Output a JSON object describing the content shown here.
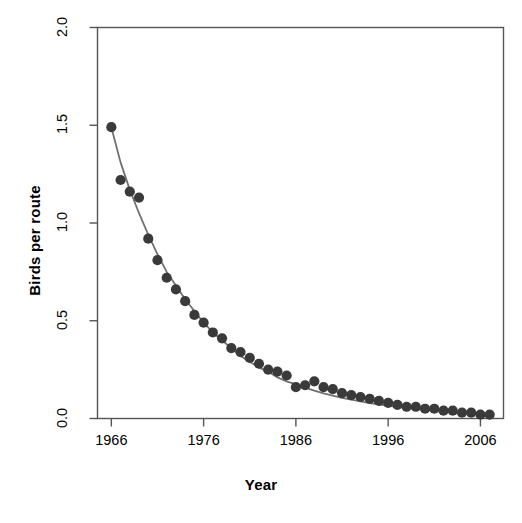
{
  "chart_data": {
    "type": "scatter",
    "title": "",
    "xlabel": "Year",
    "ylabel": "Birds per route",
    "xlim": [
      1964.5,
      2008.5
    ],
    "ylim": [
      0.0,
      2.0
    ],
    "grid": false,
    "legend": "none",
    "xticks": [
      1966,
      1976,
      1986,
      1996,
      2006
    ],
    "xtick_labels": [
      "1966",
      "1976",
      "1986",
      "1996",
      "2006"
    ],
    "yticks": [
      0.0,
      0.5,
      1.0,
      1.5,
      2.0
    ],
    "ytick_labels": [
      "0.0",
      "0.5",
      "1.0",
      "1.5",
      "2.0"
    ],
    "point_color": "#3a3a3a",
    "line_color": "#707070",
    "axis_color": "#555555",
    "series": [
      {
        "name": "Birds per route",
        "marker": "filled-circle",
        "x": [
          1966,
          1967,
          1968,
          1969,
          1970,
          1971,
          1972,
          1973,
          1974,
          1975,
          1976,
          1977,
          1978,
          1979,
          1980,
          1981,
          1982,
          1983,
          1984,
          1985,
          1986,
          1987,
          1988,
          1989,
          1990,
          1991,
          1992,
          1993,
          1994,
          1995,
          1996,
          1997,
          1998,
          1999,
          2000,
          2001,
          2002,
          2003,
          2004,
          2005,
          2006,
          2007
        ],
        "values": [
          1.49,
          1.22,
          1.16,
          1.13,
          0.92,
          0.81,
          0.72,
          0.66,
          0.6,
          0.53,
          0.49,
          0.44,
          0.41,
          0.36,
          0.34,
          0.31,
          0.28,
          0.25,
          0.24,
          0.22,
          0.16,
          0.17,
          0.19,
          0.16,
          0.15,
          0.13,
          0.12,
          0.11,
          0.1,
          0.09,
          0.08,
          0.07,
          0.06,
          0.06,
          0.05,
          0.05,
          0.04,
          0.04,
          0.03,
          0.03,
          0.02,
          0.02
        ]
      },
      {
        "name": "fitted-curve",
        "marker": "none",
        "x": [
          1966,
          1967,
          1968,
          1969,
          1970,
          1971,
          1972,
          1973,
          1974,
          1975,
          1976,
          1977,
          1978,
          1979,
          1980,
          1981,
          1982,
          1983,
          1984,
          1985,
          1986,
          1987,
          1988,
          1989,
          1990,
          1991,
          1992,
          1993,
          1994,
          1995,
          1996,
          1997,
          1998,
          1999,
          2000,
          2001,
          2002,
          2003,
          2004,
          2005,
          2006,
          2007
        ],
        "values": [
          1.49,
          1.31,
          1.17,
          1.05,
          0.94,
          0.84,
          0.75,
          0.68,
          0.61,
          0.55,
          0.49,
          0.44,
          0.4,
          0.36,
          0.32,
          0.29,
          0.26,
          0.24,
          0.21,
          0.19,
          0.175,
          0.158,
          0.143,
          0.129,
          0.117,
          0.106,
          0.096,
          0.087,
          0.079,
          0.072,
          0.065,
          0.059,
          0.054,
          0.049,
          0.044,
          0.04,
          0.036,
          0.033,
          0.03,
          0.027,
          0.025,
          0.022
        ]
      }
    ]
  }
}
